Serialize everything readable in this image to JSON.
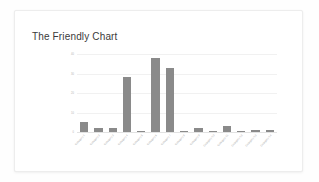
{
  "card": {
    "title": "The Friendly Chart"
  },
  "colors": {
    "bar": "#8a8a8a",
    "gridline": "#f1f1f1",
    "axis": "#e2e2e2",
    "title_text": "#3a3a3a",
    "tick_text": "#b4b4b4",
    "card_background": "#ffffff",
    "page_background": "#fefefe"
  },
  "chart_data": {
    "type": "bar",
    "title": "The Friendly Chart",
    "xlabel": "",
    "ylabel": "",
    "ylim": [
      0,
      40
    ],
    "grid": true,
    "legend": false,
    "yticks": [
      "40",
      "30",
      "20",
      "10",
      "0"
    ],
    "ytick_values": [
      40,
      30,
      20,
      10,
      0
    ],
    "categories": [
      "Category 1",
      "Category 2",
      "Category 3",
      "Category 4",
      "Category 5",
      "Category 6",
      "Category 7",
      "Category 8",
      "Category 9",
      "Category 10",
      "Category 11",
      "Category 12",
      "Category 13",
      "Category 14"
    ],
    "values": [
      5,
      2,
      2,
      28,
      0.4,
      38,
      33,
      0.5,
      2,
      0.4,
      3,
      0.4,
      1,
      0.8
    ]
  }
}
